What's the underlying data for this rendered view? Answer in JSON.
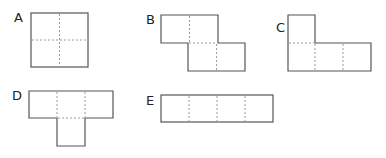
{
  "figure": {
    "colors": {
      "outline": "#555555",
      "fold_line": "#9a9a9a",
      "label": "#222222",
      "background": "#ffffff"
    },
    "shapes": [
      {
        "id": "A",
        "label": "A",
        "squares": 4,
        "arrangement": "2x2 square"
      },
      {
        "id": "B",
        "label": "B",
        "squares": 4,
        "arrangement": "S/Z shape: two squares on top, two shifted right on bottom"
      },
      {
        "id": "C",
        "label": "C",
        "squares": 4,
        "arrangement": "L shape: one square on top-left, three in a row below"
      },
      {
        "id": "D",
        "label": "D",
        "squares": 4,
        "arrangement": "T shape: three in a row on top, one below middle"
      },
      {
        "id": "E",
        "label": "E",
        "squares": 4,
        "arrangement": "I shape: four in a row"
      }
    ]
  }
}
